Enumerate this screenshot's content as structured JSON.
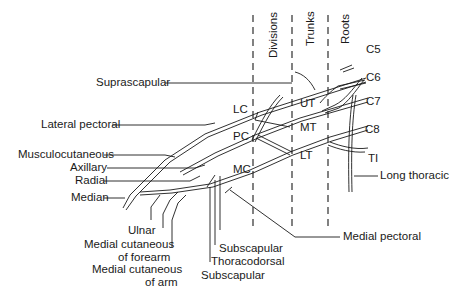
{
  "diagram": {
    "sections": [
      "Divisions",
      "Trunks",
      "Roots"
    ],
    "roots": [
      "C5",
      "C6",
      "C7",
      "C8",
      "TI"
    ],
    "trunks": [
      "UT",
      "MT",
      "LT"
    ],
    "cords": [
      "LC",
      "PC",
      "MC"
    ],
    "nerves_left": [
      "Suprascapular",
      "Lateral pectoral",
      "Musculocutaneous",
      "Axillary",
      "Radial",
      "Median"
    ],
    "nerves_bottom": {
      "ulnar": "Ulnar",
      "medial_cut_forearm_1": "Medial cutaneous",
      "medial_cut_forearm_2": "of forearm",
      "medial_cut_arm_1": "Medial cutaneous",
      "medial_cut_arm_2": "of arm",
      "upper_subscapular": "Subscapular",
      "thoracodorsal": "Thoracodorsal",
      "lower_subscapular": "Subscapular"
    },
    "nerves_right": [
      "Long thoracic",
      "Medial pectoral"
    ],
    "colors": {
      "line": "#1a1a1a",
      "background": "#ffffff"
    }
  }
}
